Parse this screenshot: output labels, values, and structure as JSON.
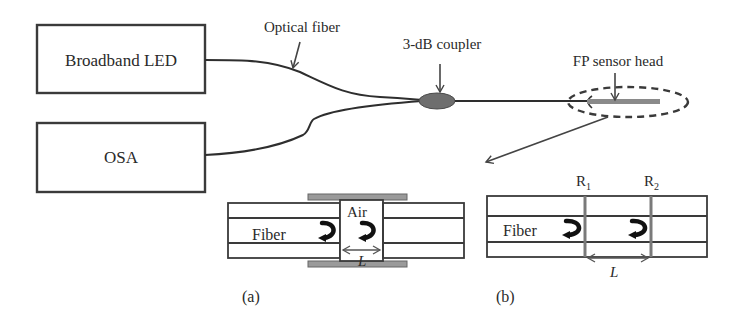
{
  "diagram": {
    "components": {
      "source": "Broadband LED",
      "analyzer": "OSA",
      "fiber_label": "Optical fiber",
      "coupler_label": "3-dB coupler",
      "sensor_label": "FP sensor head"
    },
    "inset_a": {
      "caption": "(a)",
      "fiber_label": "Fiber",
      "cavity_label": "Air",
      "length_label": "L"
    },
    "inset_b": {
      "caption": "(b)",
      "fiber_label": "Fiber",
      "mirror1_label": "R",
      "mirror1_sub": "1",
      "mirror2_label": "R",
      "mirror2_sub": "2",
      "length_label": "L"
    },
    "colors": {
      "line": "#2e2e2e",
      "coupler_fill": "#6e6e6e",
      "sensor_bar": "#8a8a8a",
      "tube": "#9a9a9a",
      "mirror": "#7a7a7a"
    }
  }
}
